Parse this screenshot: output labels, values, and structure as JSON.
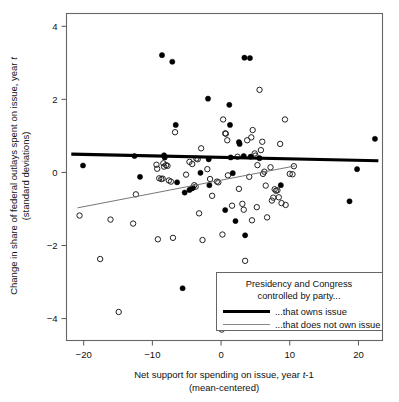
{
  "chart_data": {
    "type": "scatter",
    "title": "",
    "xlabel": "Net support for spending on issue, year t-1 (mean-centered)",
    "xlabel_line1_pre": "Net support for spending on issue, year ",
    "xlabel_line1_italic": "t",
    "xlabel_line1_post": "-1",
    "xlabel_line2": "(mean-centered)",
    "ylabel": "Change in share of federal outlays spent on issue, year t (standard deviations)",
    "ylabel_line1_pre": "Change in share of federal outlays spent on issue, year ",
    "ylabel_line1_italic": "t",
    "ylabel_line2": "(standard deviations)",
    "xlim": [
      -22.5,
      23.5
    ],
    "ylim": [
      -4.6,
      4.35
    ],
    "xticks": [
      -20,
      -10,
      0,
      10,
      20
    ],
    "xticklabels": [
      "−20",
      "−10",
      "0",
      "10",
      "20"
    ],
    "yticks": [
      4,
      2,
      0,
      -2,
      -4
    ],
    "yticklabels": [
      "4",
      "2",
      "0",
      "−2",
      "−4"
    ],
    "grid": false,
    "legend_position": "bottom-right",
    "series": [
      {
        "name": "that owns issue",
        "marker": "filled-circle",
        "color": "#000000",
        "points": [
          [
            -20.1,
            0.19
          ],
          [
            -12.6,
            0.45
          ],
          [
            -11.8,
            -0.12
          ],
          [
            -8.6,
            3.21
          ],
          [
            -8.3,
            0.47
          ],
          [
            -8.2,
            0.41
          ],
          [
            -7.1,
            3.03
          ],
          [
            -6.6,
            1.3
          ],
          [
            -6.4,
            -0.27
          ],
          [
            -5.6,
            -3.17
          ],
          [
            -5.3,
            -0.55
          ],
          [
            -4.6,
            -0.48
          ],
          [
            -4.3,
            -0.44
          ],
          [
            -4.1,
            -0.42
          ],
          [
            -3.0,
            -0.01
          ],
          [
            -1.9,
            2.02
          ],
          [
            -1.8,
            0.36
          ],
          [
            -1.7,
            -0.35
          ],
          [
            0.6,
            -1.03
          ],
          [
            1.2,
            1.85
          ],
          [
            1.3,
            1.3
          ],
          [
            1.4,
            0.41
          ],
          [
            1.7,
            -0.02
          ],
          [
            2.1,
            -1.33
          ],
          [
            2.6,
            0.83
          ],
          [
            2.7,
            0.78
          ],
          [
            3.3,
            0.45
          ],
          [
            3.4,
            3.14
          ],
          [
            3.5,
            -1.72
          ],
          [
            4.2,
            3.13
          ],
          [
            4.3,
            0.43
          ],
          [
            5.6,
            0.39
          ],
          [
            8.7,
            -0.35
          ],
          [
            18.7,
            -0.79
          ],
          [
            19.8,
            0.09
          ],
          [
            22.4,
            0.92
          ]
        ]
      },
      {
        "name": "that does not own issue",
        "marker": "open-circle",
        "color": "#222222",
        "points": [
          [
            -20.6,
            -1.18
          ],
          [
            -17.6,
            -2.37
          ],
          [
            -16.1,
            -1.29
          ],
          [
            -14.9,
            -3.82
          ],
          [
            -12.8,
            -1.4
          ],
          [
            -12.4,
            -0.6
          ],
          [
            -9.4,
            0.21
          ],
          [
            -9.3,
            0.1
          ],
          [
            -9.2,
            -1.83
          ],
          [
            -9.0,
            -0.16
          ],
          [
            -8.7,
            -0.18
          ],
          [
            -8.5,
            -0.17
          ],
          [
            -8.4,
            0.25
          ],
          [
            -8.3,
            0.16
          ],
          [
            -8.0,
            0.2
          ],
          [
            -7.8,
            0.18
          ],
          [
            -7.6,
            -0.22
          ],
          [
            -7.3,
            -0.25
          ],
          [
            -7.0,
            -1.79
          ],
          [
            -6.7,
            1.1
          ],
          [
            -5.1,
            -0.06
          ],
          [
            -4.6,
            0.29
          ],
          [
            -4.2,
            0.23
          ],
          [
            -3.9,
            -0.35
          ],
          [
            -3.7,
            -0.39
          ],
          [
            -3.6,
            0.38
          ],
          [
            -3.4,
            0.36
          ],
          [
            -3.2,
            -1.12
          ],
          [
            -2.9,
            0.66
          ],
          [
            -2.7,
            -1.85
          ],
          [
            -2.0,
            0.09
          ],
          [
            -1.6,
            -0.18
          ],
          [
            -1.3,
            -0.64
          ],
          [
            -0.6,
            -0.25
          ],
          [
            -0.4,
            -0.27
          ],
          [
            0.1,
            -4.3
          ],
          [
            0.2,
            -1.7
          ],
          [
            0.3,
            1.45
          ],
          [
            0.6,
            1.07
          ],
          [
            0.7,
            1.06
          ],
          [
            0.9,
            0.88
          ],
          [
            1.0,
            -0.08
          ],
          [
            1.6,
            -0.91
          ],
          [
            2.4,
            0.43
          ],
          [
            2.6,
            -0.45
          ],
          [
            3.1,
            -0.86
          ],
          [
            3.3,
            -1.02
          ],
          [
            3.5,
            -2.42
          ],
          [
            3.8,
            0.88
          ],
          [
            4.1,
            -0.12
          ],
          [
            4.4,
            0.96
          ],
          [
            4.5,
            -1.31
          ],
          [
            4.6,
            1.16
          ],
          [
            4.9,
            0.52
          ],
          [
            5.0,
            0.46
          ],
          [
            5.2,
            -0.95
          ],
          [
            5.3,
            0.2
          ],
          [
            5.6,
            2.26
          ],
          [
            5.8,
            0.61
          ],
          [
            6.0,
            0.84
          ],
          [
            6.1,
            -0.04
          ],
          [
            6.3,
            0.02
          ],
          [
            6.5,
            -0.36
          ],
          [
            6.7,
            -1.23
          ],
          [
            7.2,
            0.14
          ],
          [
            7.4,
            -0.77
          ],
          [
            7.6,
            -0.69
          ],
          [
            7.8,
            -0.46
          ],
          [
            8.0,
            -0.5
          ],
          [
            8.2,
            -0.49
          ],
          [
            8.4,
            -0.68
          ],
          [
            8.6,
            0.78
          ],
          [
            8.8,
            -0.84
          ],
          [
            9.3,
            1.45
          ],
          [
            9.4,
            -0.89
          ],
          [
            10.0,
            -0.04
          ],
          [
            10.4,
            -0.05
          ],
          [
            10.6,
            0.17
          ]
        ]
      }
    ],
    "fit_lines": [
      {
        "name": "that owns issue",
        "style": "thick",
        "x0": -21.8,
        "y0": 0.5,
        "x1": 22.9,
        "y1": 0.32
      },
      {
        "name": "that does not own issue",
        "style": "thin",
        "x0": -20.9,
        "y0": -0.97,
        "x1": 10.8,
        "y1": 0.18
      }
    ]
  },
  "legend": {
    "title_line1": "Presidency and Congress",
    "title_line2": "controlled by party...",
    "entries": [
      {
        "label": "...that owns issue",
        "style": "thick"
      },
      {
        "label": "...that does not own issue",
        "style": "thin"
      }
    ]
  }
}
